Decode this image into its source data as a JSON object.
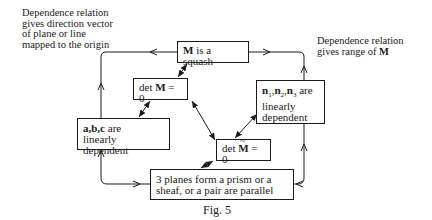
{
  "notes": {
    "left": [
      "Dependence relation",
      "gives direction vector",
      "of plane or line",
      "mapped to the origin"
    ],
    "right_line1": "Dependence relation",
    "right_line2_prefix": "gives range of ",
    "right_line2_bold": "M"
  },
  "boxes": {
    "squash": {
      "bold": "M",
      "text": " is a squash"
    },
    "det_m": {
      "prefix": "det ",
      "bold": "M",
      "suffix": " = 0"
    },
    "abc": {
      "bold": "a,b,c",
      "line1_suffix": " are",
      "line2": "linearly dependent"
    },
    "n": {
      "n1": "n",
      "s1": "1",
      "n2": "n",
      "s2": "2",
      "n3": "n",
      "s3": "3",
      "suffix": " are",
      "line2": "linearly",
      "line3": "dependent"
    },
    "det_mtilde": {
      "prefix": "det ",
      "bold": "M",
      "suffix": " = 0"
    },
    "planes": {
      "line1": "3 planes form a prism or a",
      "line2": "sheaf, or a pair are parallel"
    }
  },
  "caption": "Fig. 5"
}
